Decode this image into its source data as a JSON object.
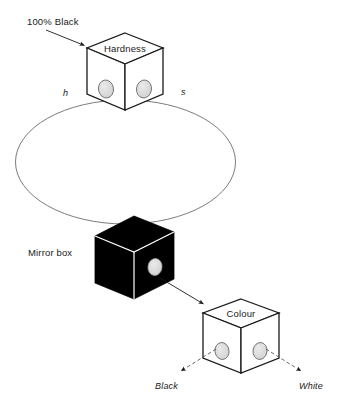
{
  "diagram": {
    "background_color": "#ffffff",
    "line_color": "#1a1a1a",
    "thin_line_color": "#555555",
    "hole_fill": "#d9d9d9",
    "black_fill": "#000000",
    "labels": {
      "black_callout": "100% Black",
      "hardness": "Hardness",
      "mirror_box": "Mirror box",
      "colour": "Colour",
      "axis_h": "h",
      "axis_s": "s",
      "out_black": "Black",
      "out_white": "White"
    },
    "nodes": [
      {
        "id": "hardness-cube",
        "label": "Hardness",
        "style": "white-cube",
        "holes": 2,
        "callout": "100% Black"
      },
      {
        "id": "mirror-box-cube",
        "label": "Mirror box",
        "style": "black-cube",
        "holes": 1,
        "callout": ""
      },
      {
        "id": "colour-cube",
        "label": "Colour",
        "style": "white-cube",
        "holes": 2,
        "callout": ""
      }
    ],
    "connectors": [
      {
        "id": "ellipse-loop",
        "from": "hardness-cube",
        "to": "mirror-box-cube",
        "style": "thin-ellipse"
      },
      {
        "id": "mirror-to-colour",
        "from": "mirror-box-cube",
        "to": "colour-cube",
        "style": "solid-arrow"
      },
      {
        "id": "colour-to-black",
        "from": "colour-cube",
        "to": "out_black",
        "style": "dashed-arrow"
      },
      {
        "id": "colour-to-white",
        "from": "colour-cube",
        "to": "out_white",
        "style": "dashed-arrow"
      },
      {
        "id": "callout-to-hardness",
        "from": "100% Black",
        "to": "hardness-cube",
        "style": "solid-arrow"
      }
    ]
  }
}
